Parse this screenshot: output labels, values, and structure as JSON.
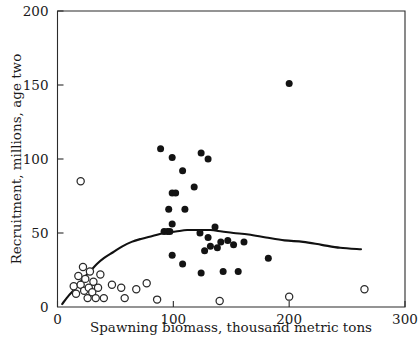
{
  "chart_data": {
    "type": "scatter",
    "title": "",
    "xlabel": "Spawning biomass, thousand metric tons",
    "ylabel": "Recruitment, millions, age two",
    "xlim": [
      0,
      300
    ],
    "ylim": [
      0,
      200
    ],
    "xticks": [
      0,
      100,
      200,
      300
    ],
    "yticks": [
      0,
      50,
      100,
      150,
      200
    ],
    "xtick_labels": [
      "0",
      "100",
      "200",
      "300"
    ],
    "ytick_labels": [
      "0",
      "50",
      "100",
      "150",
      "200"
    ],
    "grid": false,
    "legend": "none",
    "series": [
      {
        "name": "filled-points",
        "marker": "filled-circle",
        "color": "#131313",
        "points": [
          [
            89,
            107
          ],
          [
            99,
            101
          ],
          [
            108,
            92
          ],
          [
            124,
            104
          ],
          [
            130,
            100
          ],
          [
            118,
            81
          ],
          [
            99,
            77
          ],
          [
            102,
            77
          ],
          [
            96,
            66
          ],
          [
            110,
            66
          ],
          [
            99,
            56
          ],
          [
            92,
            51
          ],
          [
            95,
            51
          ],
          [
            97,
            51
          ],
          [
            123,
            50
          ],
          [
            130,
            47
          ],
          [
            136,
            54
          ],
          [
            141,
            44
          ],
          [
            147,
            45
          ],
          [
            152,
            42
          ],
          [
            132,
            41
          ],
          [
            138,
            40
          ],
          [
            161,
            44
          ],
          [
            127,
            38
          ],
          [
            99,
            35
          ],
          [
            108,
            29
          ],
          [
            124,
            23
          ],
          [
            143,
            24
          ],
          [
            156,
            24
          ],
          [
            182,
            33
          ],
          [
            200,
            151
          ]
        ]
      },
      {
        "name": "open-points",
        "marker": "open-circle",
        "color": "#ffffff",
        "points": [
          [
            20,
            85
          ],
          [
            14,
            14
          ],
          [
            16,
            9
          ],
          [
            18,
            21
          ],
          [
            20,
            15
          ],
          [
            22,
            27
          ],
          [
            23,
            11
          ],
          [
            24,
            19
          ],
          [
            26,
            6
          ],
          [
            27,
            13
          ],
          [
            28,
            24
          ],
          [
            30,
            10
          ],
          [
            31,
            17
          ],
          [
            33,
            6
          ],
          [
            35,
            13
          ],
          [
            37,
            22
          ],
          [
            40,
            6
          ],
          [
            47,
            15
          ],
          [
            55,
            13
          ],
          [
            58,
            6
          ],
          [
            68,
            12
          ],
          [
            77,
            16
          ],
          [
            86,
            5
          ],
          [
            140,
            4
          ],
          [
            200,
            7
          ],
          [
            265,
            12
          ]
        ]
      }
    ],
    "fit_curve": {
      "name": "ricker-stock-recruitment-curve",
      "color": "#111111",
      "points": [
        [
          4,
          2
        ],
        [
          10,
          8
        ],
        [
          16,
          13
        ],
        [
          22,
          19
        ],
        [
          28,
          24
        ],
        [
          34,
          29
        ],
        [
          40,
          33
        ],
        [
          48,
          37
        ],
        [
          56,
          41
        ],
        [
          64,
          44
        ],
        [
          72,
          46
        ],
        [
          82,
          48
        ],
        [
          92,
          50
        ],
        [
          102,
          51
        ],
        [
          112,
          52
        ],
        [
          122,
          52
        ],
        [
          132,
          52
        ],
        [
          142,
          51
        ],
        [
          152,
          50
        ],
        [
          165,
          49
        ],
        [
          180,
          47
        ],
        [
          196,
          45
        ],
        [
          212,
          44
        ],
        [
          228,
          42
        ],
        [
          244,
          40
        ],
        [
          262,
          39
        ]
      ]
    }
  }
}
